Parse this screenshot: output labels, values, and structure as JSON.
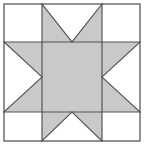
{
  "figure": {
    "name": "quilt-block-diagram",
    "canvas": {
      "width": 146,
      "height": 151
    },
    "colors": {
      "background": "#ffffff",
      "patch_shaded": "#c9c9c9",
      "patch_plain": "#ffffff",
      "seam_line": "#555555",
      "outer_border": "#4a4a4a"
    },
    "geometry": {
      "frame": {
        "left": 4,
        "top": 4,
        "right": 140,
        "bottom": 141
      },
      "grid_x": [
        4,
        42,
        102,
        140
      ],
      "grid_y": [
        4,
        42,
        112,
        141
      ],
      "stroke_width": 1.2,
      "columns": 3,
      "rows": 3
    },
    "patches": [
      {
        "id": "corner-top-left",
        "row": 1,
        "col": 1,
        "type": "plain-square",
        "fill": "#ffffff",
        "points": "4,4 42,4 42,42 4,42"
      },
      {
        "id": "edge-top",
        "row": 1,
        "col": 2,
        "type": "flying-geese",
        "fill": "#c9c9c9",
        "points": "42,4 102,4 102,42 42,42",
        "notch": "42,4 102,4 72,42",
        "notch_fill": "#ffffff",
        "apex": "down"
      },
      {
        "id": "corner-top-right",
        "row": 1,
        "col": 3,
        "type": "plain-square",
        "fill": "#ffffff",
        "points": "102,4 140,4 140,42 102,42"
      },
      {
        "id": "edge-left",
        "row": 2,
        "col": 1,
        "type": "flying-geese",
        "fill": "#c9c9c9",
        "points": "4,42 42,42 42,112 4,112",
        "notch": "4,42 4,112 42,77",
        "notch_fill": "#ffffff",
        "apex": "right"
      },
      {
        "id": "center-square",
        "row": 2,
        "col": 2,
        "type": "plain-square",
        "fill": "#c9c9c9",
        "points": "42,42 102,42 102,112 42,112"
      },
      {
        "id": "edge-right",
        "row": 2,
        "col": 3,
        "type": "flying-geese",
        "fill": "#c9c9c9",
        "points": "102,42 140,42 140,112 102,112",
        "notch": "140,42 140,112 102,77",
        "notch_fill": "#ffffff",
        "apex": "left"
      },
      {
        "id": "corner-bottom-left",
        "row": 3,
        "col": 1,
        "type": "plain-square",
        "fill": "#ffffff",
        "points": "4,112 42,112 42,141 4,141"
      },
      {
        "id": "edge-bottom",
        "row": 3,
        "col": 2,
        "type": "flying-geese",
        "fill": "#c9c9c9",
        "points": "42,112 102,112 102,141 42,141",
        "notch": "42,141 102,141 72,112",
        "notch_fill": "#ffffff",
        "apex": "up"
      },
      {
        "id": "corner-bottom-right",
        "row": 3,
        "col": 3,
        "type": "plain-square",
        "fill": "#ffffff",
        "points": "102,112 140,112 140,141 102,141"
      }
    ]
  }
}
